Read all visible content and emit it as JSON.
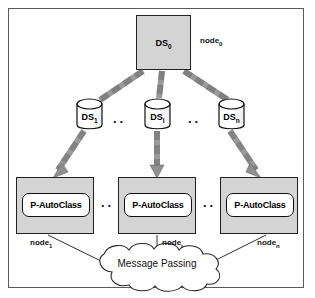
{
  "figure": {
    "colors": {
      "node_fill": "#d4d4d4",
      "arrow_fill": "#9a9a9a",
      "outline": "#222222",
      "frame": "#5b5b5b",
      "background": "#ffffff"
    }
  },
  "master": {
    "node_label": "node",
    "node_subscript": "0",
    "datastore_label": "DS",
    "datastore_subscript": "0"
  },
  "datastores": [
    {
      "label": "DS",
      "subscript": "1",
      "name": "datastore-1"
    },
    {
      "label": "DS",
      "subscript": "i",
      "name": "datastore-i"
    },
    {
      "label": "DS",
      "subscript": "n",
      "name": "datastore-n"
    }
  ],
  "workers": [
    {
      "process_label": "P-AutoClass",
      "node_label": "node",
      "node_subscript": "1"
    },
    {
      "process_label": "P-AutoClass",
      "node_label": "node",
      "node_subscript": "i"
    },
    {
      "process_label": "P-AutoClass",
      "node_label": "node",
      "node_subscript": "n"
    }
  ],
  "ellipses": {
    "datastore_left": "..",
    "datastore_right": "..",
    "autoclass_left": "..",
    "autoclass_right": ".."
  },
  "cloud": {
    "label": "Message Passing"
  }
}
